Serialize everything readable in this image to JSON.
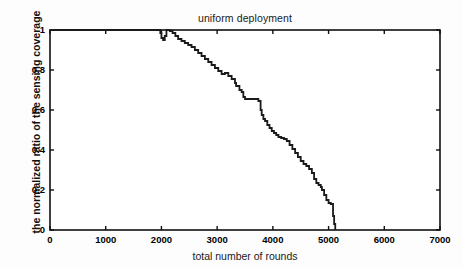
{
  "chart_data": {
    "type": "line",
    "title": "uniform deployment",
    "xlabel": "total number of rounds",
    "ylabel": "the normalized ratio of the sensing coverage",
    "xlim": [
      0,
      7000
    ],
    "ylim": [
      0,
      1
    ],
    "xticks": [
      0,
      1000,
      2000,
      3000,
      4000,
      5000,
      6000,
      7000
    ],
    "xtick_labels": [
      "0",
      "1000",
      "2000",
      "3000",
      "4000",
      "5000",
      "6000",
      "7000"
    ],
    "yticks": [
      0,
      0.2,
      0.4,
      0.6,
      0.8,
      1
    ],
    "ytick_labels": [
      "0",
      "0.2",
      "0.4",
      "0.6",
      "0.8",
      "1"
    ],
    "grid": false,
    "legend": null,
    "line_color": "#1a1a1a",
    "line_width": 1.8,
    "series": [
      {
        "name": "normalized sensing coverage",
        "x": [
          0,
          1950,
          1980,
          2000,
          2030,
          2060,
          2090,
          2120,
          2150,
          2200,
          2250,
          2300,
          2360,
          2420,
          2480,
          2540,
          2600,
          2660,
          2720,
          2780,
          2840,
          2900,
          2960,
          3020,
          3080,
          3140,
          3200,
          3260,
          3320,
          3340,
          3400,
          3440,
          3470,
          3500,
          3560,
          3620,
          3680,
          3740,
          3780,
          3800,
          3830,
          3860,
          3900,
          3940,
          3980,
          4020,
          4060,
          4100,
          4150,
          4200,
          4250,
          4300,
          4350,
          4400,
          4450,
          4500,
          4550,
          4600,
          4650,
          4700,
          4740,
          4780,
          4820,
          4860,
          4880,
          4920,
          4960,
          5000,
          5040,
          5080,
          5100,
          5120
        ],
        "y": [
          1,
          1,
          0.985,
          0.96,
          0.95,
          0.97,
          1,
          1,
          0.995,
          0.985,
          0.97,
          0.955,
          0.945,
          0.935,
          0.925,
          0.915,
          0.9,
          0.885,
          0.87,
          0.855,
          0.84,
          0.825,
          0.81,
          0.795,
          0.78,
          0.785,
          0.77,
          0.755,
          0.735,
          0.72,
          0.7,
          0.69,
          0.665,
          0.655,
          0.655,
          0.655,
          0.655,
          0.645,
          0.6,
          0.575,
          0.555,
          0.545,
          0.525,
          0.51,
          0.495,
          0.485,
          0.475,
          0.465,
          0.46,
          0.455,
          0.445,
          0.425,
          0.405,
          0.385,
          0.365,
          0.345,
          0.33,
          0.32,
          0.305,
          0.285,
          0.255,
          0.235,
          0.225,
          0.215,
          0.2,
          0.175,
          0.15,
          0.135,
          0.13,
          0.07,
          0.03,
          0
        ]
      }
    ]
  }
}
